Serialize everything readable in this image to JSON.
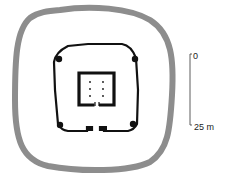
{
  "diagram": {
    "type": "archaeological-site-plan",
    "features": [
      {
        "name": "outer-enclosure-ring",
        "color": "#8a8a8a"
      },
      {
        "name": "inner-enclosure-wall",
        "color": "#111111",
        "corner_towers": 4,
        "entrance": "south gate"
      },
      {
        "name": "central-building",
        "color": "#111111",
        "column_dots": 6,
        "entrance": "south"
      }
    ]
  },
  "scale_bar": {
    "top_label": "0",
    "bottom_label": "25 m"
  }
}
